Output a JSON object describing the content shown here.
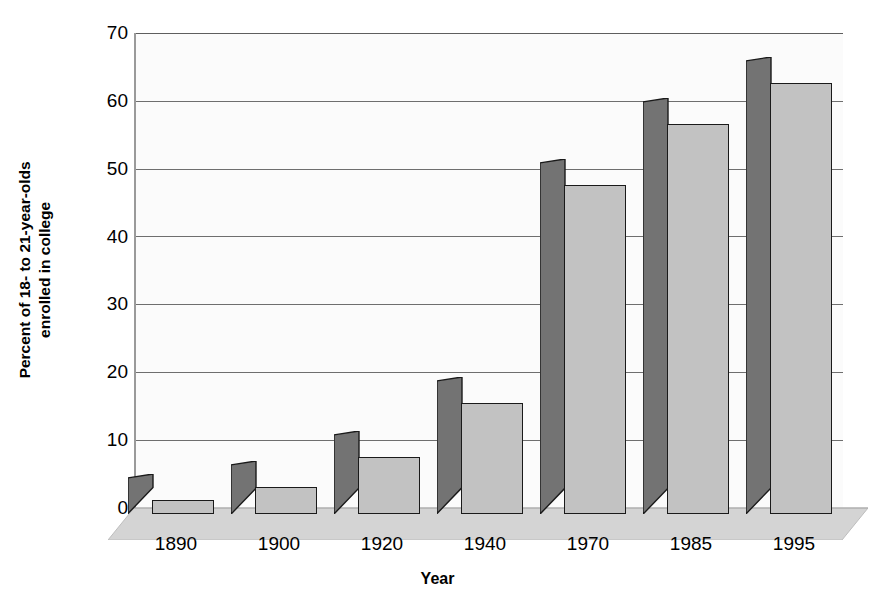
{
  "chart_data": {
    "type": "bar",
    "title": "",
    "subtitle": "",
    "xlabel": "Year",
    "ylabel": "Percent of 18- to 21-year-olds enrolled in college",
    "ylabel_line1": "Percent of 18- to 21-year-olds",
    "ylabel_line2": "enrolled in college",
    "categories": [
      "1890",
      "1900",
      "1920",
      "1940",
      "1970",
      "1985",
      "1995"
    ],
    "values": [
      2.0,
      4.0,
      8.4,
      16.3,
      48.5,
      57.5,
      63.5
    ],
    "series": [
      {
        "name": "Percent enrolled in college",
        "values": [
          2.0,
          4.0,
          8.4,
          16.3,
          48.5,
          57.5,
          63.5
        ]
      }
    ],
    "ylim": [
      0,
      70
    ],
    "yticks": [
      0,
      10,
      20,
      30,
      40,
      50,
      60,
      70
    ],
    "ytick_labels": [
      "0",
      "10",
      "20",
      "30",
      "40",
      "50",
      "60",
      "70"
    ],
    "xtick_labels": [
      "1890",
      "1900",
      "1920",
      "1940",
      "1970",
      "1985",
      "1995"
    ],
    "grid": true,
    "grid_axis": "y",
    "legend": false,
    "legend_position": "none",
    "style": "3d-perspective-bars",
    "colors": {
      "bar_front": "#c2c2c2",
      "bar_side": "#737373",
      "bar_outline": "#1a1a1a",
      "gridline": "#6e6e6e",
      "plot_background": "#fbfbfb",
      "floor": "#d4d4d4",
      "axis": "#9a9a9a",
      "text": "#000000"
    }
  }
}
